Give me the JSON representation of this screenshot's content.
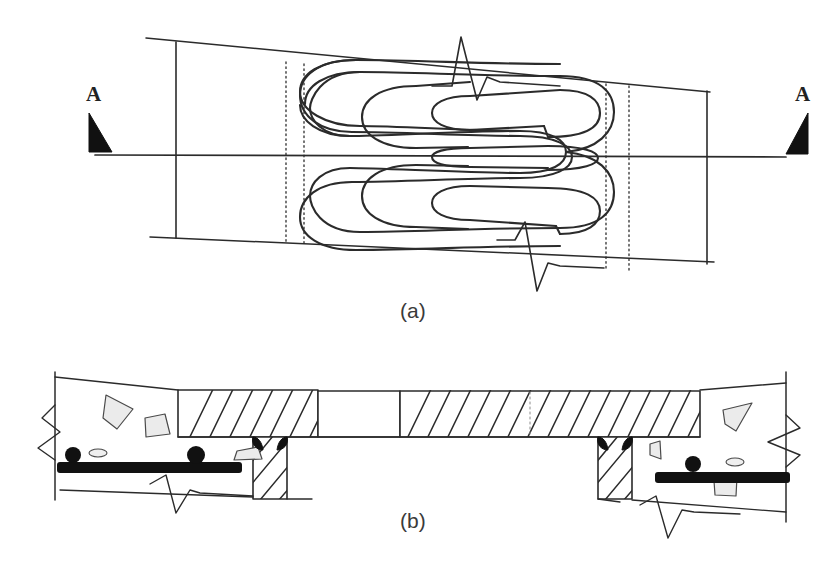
{
  "figure": {
    "type": "engineering-drawing",
    "background_color": "#ffffff",
    "ink_color": "#2b2b2b",
    "weld_fill_color": "#111111",
    "rebar_color": "#111111",
    "aggregate_fill_color": "#e8e8e8"
  },
  "panel_a": {
    "caption": "(a)",
    "section_label_left": "A",
    "section_label_right": "A",
    "section_marker_left_name": "section-arrow-left",
    "section_marker_right_name": "section-arrow-right",
    "centerline": "horizontal-centerline",
    "weld_pattern": "serpentine-zigzag-bead",
    "break_symbol_top": "zigzag-break-top",
    "break_symbol_bottom": "zigzag-break-bottom",
    "hidden_lines": [
      "dotted-line-1",
      "dotted-line-2",
      "dotted-line-3",
      "dotted-line-4"
    ]
  },
  "panel_b": {
    "caption": "(b)",
    "plate_left": "hatched-steel-plate-left",
    "plate_right": "hatched-steel-plate-right",
    "gap": "plate-gap",
    "stem_left": "hatched-steel-stem-left",
    "stem_right": "hatched-steel-stem-right",
    "weld_fillets": "black-fillet-welds",
    "rebar_left": "longitudinal-rebar-left",
    "rebar_right": "longitudinal-rebar-right",
    "rebar_dots_left": [
      "rebar-section-dot",
      "rebar-section-dot"
    ],
    "rebar_dots_right": [
      "rebar-section-dot"
    ],
    "concrete_left": "concrete-region-left",
    "concrete_right": "concrete-region-right",
    "break_symbols": [
      "break-left-edge",
      "break-right-edge",
      "break-bottom-left",
      "break-bottom-right"
    ]
  }
}
